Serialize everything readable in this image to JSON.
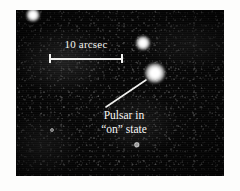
{
  "figure": {
    "type": "astronomical-image",
    "caption_absent": true,
    "background_color": "#ffffff",
    "plate": {
      "x": 16,
      "y": 10,
      "width": 208,
      "height": 166,
      "sky_color": "#050505",
      "description": "Grainy monochrome CCD sky image, dark noisy background"
    }
  },
  "scale_bar": {
    "label": "10 arcsec",
    "color": "#f2f2f0",
    "x": 33,
    "y": 44,
    "length_px": 74,
    "end_caps": true,
    "label_position": "above"
  },
  "annotation": {
    "line1": "Pulsar in",
    "line2": "“on” state",
    "color": "#f6f6f4",
    "leader_line": {
      "from_x": 90,
      "from_y": 97,
      "to_x": 130,
      "to_y": 70,
      "color": "#f0f0ee"
    }
  },
  "sources": [
    {
      "name": "star-upper-left",
      "cx": 17,
      "cy": 5,
      "r": 7.0,
      "peak": "#ffffff",
      "label": ""
    },
    {
      "name": "star-companion",
      "cx": 127,
      "cy": 33,
      "r": 7.5,
      "peak": "#ffffff",
      "label": ""
    },
    {
      "name": "pulsar-on-state",
      "cx": 139,
      "cy": 63,
      "r": 10.5,
      "peak": "#ffffff",
      "label": "Pulsar in “on” state"
    },
    {
      "name": "faint-source",
      "cx": 121,
      "cy": 135,
      "r": 3.2,
      "peak": "#9a9a9a",
      "label": ""
    },
    {
      "name": "faint-source-2",
      "cx": 36,
      "cy": 120,
      "r": 2.0,
      "peak": "#7d7d7d",
      "label": ""
    }
  ]
}
